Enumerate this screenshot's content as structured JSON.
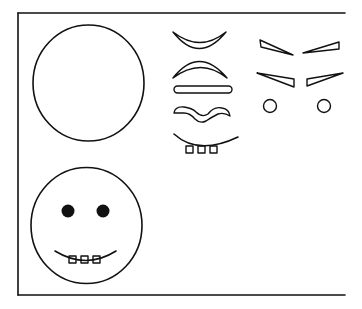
{
  "figure": {
    "description": "Face construction kit: blank face outline, interchangeable mouth shapes, eyebrow shapes, eyes, and an assembled face",
    "colors": {
      "ink": "#111111",
      "background": "#ffffff"
    }
  },
  "parts": {
    "blank_face": {
      "label": "blank-face-outline"
    },
    "mouths": [
      {
        "id": "smile-crescent",
        "label": "smile"
      },
      {
        "id": "frown-crescent",
        "label": "frown"
      },
      {
        "id": "neutral-bar",
        "label": "neutral"
      },
      {
        "id": "wavy",
        "label": "wavy"
      },
      {
        "id": "toothy-grin",
        "label": "toothy grin"
      }
    ],
    "eyebrows": [
      {
        "id": "eyebrows-raised",
        "label": "raised eyebrows"
      },
      {
        "id": "eyebrows-angry",
        "label": "angled eyebrows"
      }
    ],
    "eyes": {
      "id": "eyes-open",
      "label": "open eyes"
    }
  },
  "assembled_face": {
    "eyes": "filled dots",
    "mouth": "toothy grin"
  }
}
